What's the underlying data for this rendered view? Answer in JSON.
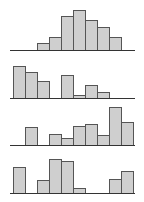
{
  "colors": {
    "bar_fill": "#cfcfcf",
    "bar_stroke": "#555555",
    "axis": "#333333",
    "background": "#ffffff"
  },
  "layout": {
    "bin_width_px": 12,
    "bin_origin_x": 13,
    "axis_x_start": 10,
    "axis_x_end": 135
  },
  "chart_data": [
    {
      "type": "bar",
      "title": "",
      "xlabel": "",
      "ylabel": "",
      "grid": false,
      "legend": null,
      "baseline_y": 50,
      "bins": [
        0,
        1,
        2,
        3,
        4,
        5,
        6,
        7,
        8,
        9
      ],
      "values": [
        0,
        0,
        7,
        13,
        34,
        40,
        30,
        23,
        13,
        0
      ]
    },
    {
      "type": "bar",
      "title": "",
      "xlabel": "",
      "ylabel": "",
      "grid": false,
      "legend": null,
      "baseline_y": 98,
      "bins": [
        0,
        1,
        2,
        3,
        4,
        5,
        6,
        7,
        8,
        9
      ],
      "values": [
        32,
        26,
        17,
        0,
        23,
        3,
        13,
        6,
        0,
        0
      ]
    },
    {
      "type": "bar",
      "title": "",
      "xlabel": "",
      "ylabel": "",
      "grid": false,
      "legend": null,
      "baseline_y": 145,
      "bins": [
        0,
        1,
        2,
        3,
        4,
        5,
        6,
        7,
        8,
        9
      ],
      "values": [
        0,
        18,
        0,
        11,
        7,
        19,
        21,
        10,
        38,
        23
      ]
    },
    {
      "type": "bar",
      "title": "",
      "xlabel": "",
      "ylabel": "",
      "grid": false,
      "legend": null,
      "baseline_y": 193,
      "bins": [
        0,
        1,
        2,
        3,
        4,
        5,
        6,
        7,
        8,
        9
      ],
      "values": [
        26,
        0,
        13,
        34,
        32,
        5,
        0,
        0,
        14,
        22
      ]
    }
  ]
}
